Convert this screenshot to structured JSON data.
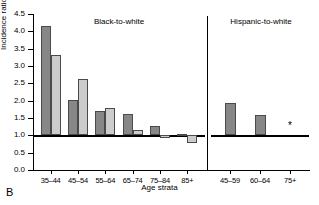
{
  "panel_label": "B",
  "chart_data": {
    "type": "bar",
    "title": "",
    "xlabel": "Age strata",
    "ylabel": "Incidence ratio",
    "ylim": [
      0.0,
      4.5
    ],
    "ytick_labels": [
      "0.0",
      "0.5",
      "1.0",
      "1.5",
      "2.0",
      "2.5",
      "3.0",
      "3.5",
      "4.0",
      "4.5"
    ],
    "ytick_values": [
      0.0,
      0.5,
      1.0,
      1.5,
      2.0,
      2.5,
      3.0,
      3.5,
      4.0,
      4.5
    ],
    "reference_line": 1.0,
    "grid": false,
    "legend_position": "none",
    "panels": [
      {
        "name": "black-to-white",
        "header": "Black-to-white",
        "categories": [
          "35–44",
          "45–54",
          "55–64",
          "65–74",
          "75–84",
          "85+"
        ],
        "series": [
          {
            "name": "series-dark",
            "values": [
              4.15,
              2.02,
              1.7,
              1.62,
              1.28,
              1.03
            ]
          },
          {
            "name": "series-light",
            "values": [
              3.32,
              2.62,
              1.8,
              1.15,
              0.93,
              0.78
            ]
          }
        ]
      },
      {
        "name": "hispanic-to-white",
        "header": "Hispanic-to-white",
        "categories": [
          "45–59",
          "60–64",
          "75+"
        ],
        "series": [
          {
            "name": "series-dark",
            "values": [
              1.92,
              1.6,
              null
            ]
          }
        ],
        "annotations": [
          {
            "category": "75+",
            "marker": "*",
            "value": 1.0
          }
        ]
      }
    ]
  }
}
